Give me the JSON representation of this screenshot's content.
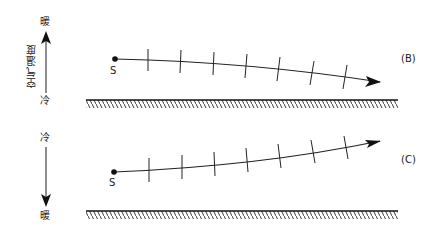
{
  "axis": {
    "title": "空气温度",
    "upper": {
      "top_label": "暖",
      "bottom_label": "冷",
      "direction": "up"
    },
    "lower": {
      "top_label": "冷",
      "bottom_label": "暖",
      "direction": "down"
    }
  },
  "panels": [
    {
      "id": "B",
      "label": "(B)",
      "source_label": "S",
      "trajectory": "descending",
      "tick_count": 7
    },
    {
      "id": "C",
      "label": "(C)",
      "source_label": "S",
      "trajectory": "ascending",
      "tick_count": 7
    }
  ],
  "colors": {
    "line": "#1a1a1a",
    "background": "#ffffff"
  }
}
